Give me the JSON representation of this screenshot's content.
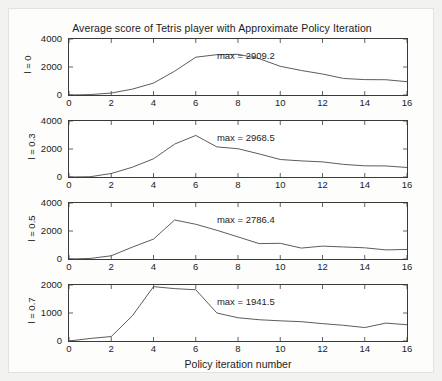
{
  "chart_data": {
    "type": "line",
    "title": "Average score of Tetris player with Approximate Policy Iteration",
    "xlabel": "Policy iteration number",
    "ylabel": "",
    "xlim": [
      0,
      16
    ],
    "xticks": [
      0,
      2,
      4,
      6,
      8,
      10,
      12,
      14,
      16
    ],
    "grid": false,
    "legend": null,
    "panels": [
      {
        "row_label": "l = 0",
        "annotation": "max = 2909.2",
        "max_value": 2909.2,
        "ylim": [
          0,
          4000
        ],
        "yticks": [
          0,
          2000,
          4000
        ],
        "x": [
          0,
          1,
          2,
          3,
          4,
          5,
          6,
          7,
          8,
          9,
          10,
          11,
          12,
          13,
          14,
          15,
          16
        ],
        "values": [
          0,
          30,
          140,
          420,
          850,
          1700,
          2700,
          2880,
          2909.2,
          2600,
          2050,
          1750,
          1500,
          1180,
          1100,
          1090,
          950
        ]
      },
      {
        "row_label": "l = 0.3",
        "annotation": "max = 2968.5",
        "max_value": 2968.5,
        "ylim": [
          0,
          4000
        ],
        "yticks": [
          0,
          2000,
          4000
        ],
        "x": [
          0,
          1,
          2,
          3,
          4,
          5,
          6,
          7,
          8,
          9,
          10,
          11,
          12,
          13,
          14,
          15,
          16
        ],
        "values": [
          0,
          20,
          250,
          700,
          1300,
          2350,
          2968.5,
          2150,
          2020,
          1650,
          1250,
          1150,
          1080,
          900,
          800,
          790,
          680
        ]
      },
      {
        "row_label": "l = 0.5",
        "annotation": "max = 2786.4",
        "max_value": 2786.4,
        "ylim": [
          0,
          4000
        ],
        "yticks": [
          0,
          2000,
          4000
        ],
        "x": [
          0,
          1,
          2,
          3,
          4,
          5,
          6,
          7,
          8,
          9,
          10,
          11,
          12,
          13,
          14,
          15,
          16
        ],
        "values": [
          0,
          40,
          230,
          850,
          1420,
          2786.4,
          2480,
          2050,
          1580,
          1100,
          1120,
          780,
          920,
          860,
          800,
          650,
          680
        ]
      },
      {
        "row_label": "l = 0.7",
        "annotation": "max = 1941.5",
        "max_value": 1941.5,
        "ylim": [
          0,
          2000
        ],
        "yticks": [
          0,
          1000,
          2000
        ],
        "x": [
          0,
          1,
          2,
          3,
          4,
          5,
          6,
          7,
          8,
          9,
          10,
          11,
          12,
          13,
          14,
          15,
          16
        ],
        "values": [
          0,
          90,
          160,
          900,
          1941.5,
          1870,
          1830,
          1000,
          830,
          760,
          720,
          690,
          620,
          560,
          480,
          640,
          580
        ]
      }
    ]
  }
}
